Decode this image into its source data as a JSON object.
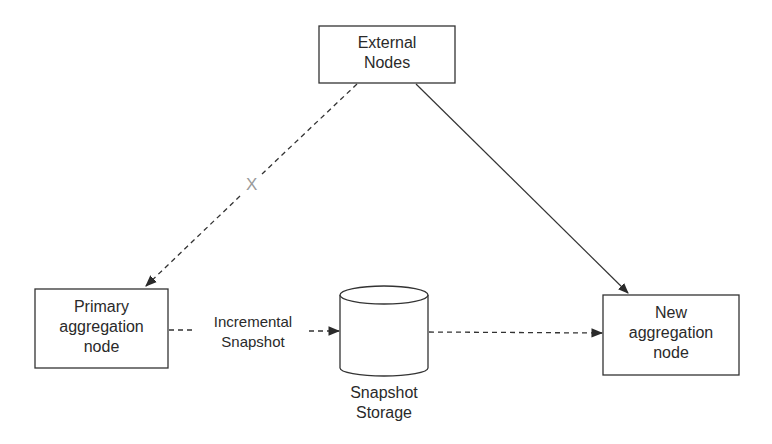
{
  "diagram": {
    "nodes": {
      "external": {
        "label": "External\nNodes",
        "shape": "rectangle"
      },
      "primary": {
        "label": "Primary\naggregation\nnode",
        "shape": "rectangle"
      },
      "storage": {
        "label": "Snapshot\nStorage",
        "shape": "cylinder"
      },
      "new_node": {
        "label": "New\naggregation\nnode",
        "shape": "rectangle"
      }
    },
    "edges": [
      {
        "from": "External Nodes",
        "to": "Primary aggregation node",
        "style": "dashed",
        "marker": "X",
        "blocked": true
      },
      {
        "from": "External Nodes",
        "to": "New aggregation node",
        "style": "solid"
      },
      {
        "from": "Primary aggregation node",
        "to": "Snapshot Storage",
        "style": "dashed",
        "label": "Incremental\nSnapshot"
      },
      {
        "from": "Snapshot Storage",
        "to": "New aggregation node",
        "style": "dashed"
      }
    ],
    "edge_labels": {
      "incremental": "Incremental\nSnapshot",
      "blocked_marker": "X"
    },
    "colors": {
      "stroke": "#333333",
      "marker": "#9a9a9a",
      "background": "#ffffff"
    }
  }
}
